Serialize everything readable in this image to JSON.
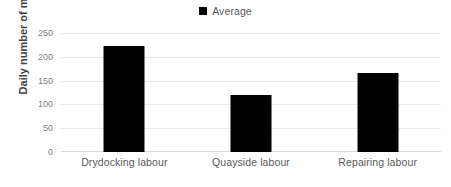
{
  "chart_data": {
    "type": "bar",
    "title": "",
    "subtitle": "",
    "xlabel": "",
    "ylabel": "Daily number of men",
    "categories": [
      "Drydocking labour",
      "Quayside labour",
      "Repairing labour"
    ],
    "series": [
      {
        "name": "Average",
        "color": "#000000",
        "values": [
          222,
          120,
          167
        ]
      }
    ],
    "values": [
      222,
      120,
      167
    ],
    "ylim": [
      0,
      250
    ],
    "yticks": [
      250,
      200,
      150,
      100,
      50,
      0
    ],
    "ytick_labels": [
      "250",
      "200",
      "150",
      "100",
      "50",
      "0"
    ],
    "grid": true,
    "grid_color": "#e8e8e8",
    "legend": {
      "position": "top-center",
      "entries": [
        {
          "label": "Average",
          "color": "#000000",
          "marker": "square-marker"
        }
      ]
    },
    "background_color": "#ffffff",
    "axis_text_color": "#595959",
    "tick_text_color": "#7f7f7f"
  }
}
